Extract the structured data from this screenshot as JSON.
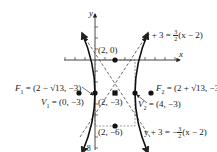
{
  "diagram": {
    "type": "hyperbola-graph",
    "axes": {
      "x_label": "x",
      "y_label": "y",
      "y_tick_label": "-8"
    },
    "points": [
      {
        "id": "top",
        "label": "(2, 0)"
      },
      {
        "id": "center",
        "label": "(2, −3)"
      },
      {
        "id": "bottom",
        "label": "(2, −6)"
      }
    ],
    "foci": {
      "f1": {
        "name": "F",
        "sub": "1",
        "value": "= (2 − √13, −3)"
      },
      "f2": {
        "name": "F",
        "sub": "2",
        "value": "= (2 + √13, −3)"
      }
    },
    "vertices": {
      "v1": {
        "name": "V",
        "sub": "1",
        "value": "= (0, −3)"
      },
      "v2": {
        "name": "V",
        "sub": "2",
        "value": "= (4, −3)"
      }
    },
    "asymptotes": {
      "upper": {
        "lhs": "y + 3 = ",
        "num": "3",
        "den": "2",
        "rhs": "(x − 2)",
        "sign": ""
      },
      "lower": {
        "lhs": "y + 3 = −",
        "num": "3",
        "den": "2",
        "rhs": "(x − 2)",
        "sign": "−"
      }
    },
    "colors": {
      "ink": "#222222",
      "background": "#ffffff"
    }
  }
}
